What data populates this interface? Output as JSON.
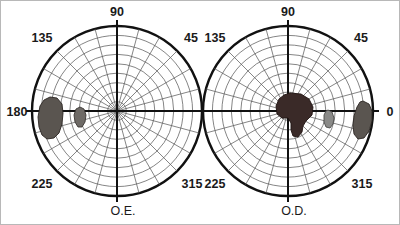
{
  "figure": {
    "background_color": "#ffffff",
    "width": 400,
    "height": 225,
    "grid_color": "#5c5c5c",
    "axis_color": "#111111",
    "outline_color": "#111111",
    "label_color": "#1a1a1a"
  },
  "chart_data": [
    {
      "type": "scatter",
      "chart_id": "left-polar-plot",
      "title": "O.E.",
      "subtitle": "",
      "projection": "polar",
      "xlabel": "",
      "ylabel": "",
      "center": {
        "x": 117,
        "y": 111
      },
      "outer_radius": 85,
      "rings": 9,
      "ring_radii": [
        9.4,
        18.9,
        28.3,
        37.8,
        47.2,
        56.7,
        66.1,
        75.6,
        85
      ],
      "spoke_step_degrees": 15,
      "spoke_count": 24,
      "major_axes_degrees": [
        0,
        90,
        180,
        270
      ],
      "grid": true,
      "legend_position": "none",
      "tick_labels": [
        "90",
        "45",
        "0",
        "315",
        "225",
        "180",
        "135"
      ],
      "visible_tick_labels": [
        "90",
        "135",
        "45",
        "180",
        "225",
        "315"
      ],
      "axis_range_degrees": [
        0,
        360
      ],
      "regions": [
        {
          "name": "large-scotoma-left-temporal",
          "label": "",
          "fill": "#5a5550",
          "outline": "#2b2622",
          "center_angle_deg": 178,
          "center_radius_units": 68,
          "approx_width_px": 23,
          "approx_height_px": 41,
          "points": "50,97 57,98 62,104 63,113 62,124 59,133 54,138 47,139 42,135 39,127 38,117 40,106 44,100"
        },
        {
          "name": "small-scotoma-left-paracentral",
          "label": "",
          "fill": "#6e6a66",
          "outline": "#3a3532",
          "center_angle_deg": 179,
          "center_radius_units": 36,
          "approx_width_px": 10,
          "approx_height_px": 20,
          "points": "80,107 84,109 86,115 85,122 82,127 78,127 75,122 74,115 76,109"
        }
      ]
    },
    {
      "type": "scatter",
      "chart_id": "right-polar-plot",
      "title": "O.D.",
      "subtitle": "",
      "projection": "polar",
      "xlabel": "",
      "ylabel": "",
      "center": {
        "x": 288,
        "y": 111
      },
      "outer_radius": 85,
      "rings": 9,
      "ring_radii": [
        9.4,
        18.9,
        28.3,
        37.8,
        47.2,
        56.7,
        66.1,
        75.6,
        85
      ],
      "spoke_step_degrees": 15,
      "spoke_count": 24,
      "major_axes_degrees": [
        0,
        90,
        180,
        270
      ],
      "grid": true,
      "legend_position": "none",
      "tick_labels": [
        "90",
        "45",
        "0",
        "315",
        "225",
        "180",
        "135"
      ],
      "visible_tick_labels": [
        "90",
        "135",
        "45",
        "0",
        "225",
        "315"
      ],
      "axis_range_degrees": [
        0,
        360
      ],
      "regions": [
        {
          "name": "central-scotoma-right",
          "label": "",
          "fill": "#3a2a28",
          "outline": "#201412",
          "center_angle_deg": 200,
          "center_radius_units": 14,
          "approx_width_px": 37,
          "approx_height_px": 45,
          "points": "290,93 301,94 309,99 313,107 312,115 306,121 303,126 302,132 298,137 293,136 291,130 291,123 288,118 282,118 277,114 276,106 279,99 284,95"
        },
        {
          "name": "small-scotoma-right-paracentral",
          "label": "",
          "fill": "#8a8a88",
          "outline": "#4a4a48",
          "center_angle_deg": 354,
          "center_radius_units": 36,
          "approx_width_px": 10,
          "approx_height_px": 19,
          "points": "328,110 332,112 334,118 333,124 330,128 326,127 324,122 324,115 326,111"
        },
        {
          "name": "blind-spot-right-temporal",
          "label": "",
          "fill": "#5a5550",
          "outline": "#2b2622",
          "center_angle_deg": 2,
          "center_radius_units": 73,
          "approx_width_px": 20,
          "approx_height_px": 39,
          "points": "363,101 369,104 372,111 372,121 369,131 364,138 358,139 354,134 353,126 354,116 357,107 360,102"
        }
      ]
    }
  ],
  "charts": [
    {
      "id": "left-polar-plot",
      "eye_label": "O.E.",
      "degree_labels": [
        {
          "text": "90",
          "x": 117,
          "y": 16,
          "anchor": "middle"
        },
        {
          "text": "135",
          "x": 42,
          "y": 42,
          "anchor": "middle"
        },
        {
          "text": "45",
          "x": 191,
          "y": 42,
          "anchor": "middle"
        },
        {
          "text": "180",
          "x": 17,
          "y": 116,
          "anchor": "middle"
        },
        {
          "text": "225",
          "x": 42,
          "y": 188,
          "anchor": "middle"
        },
        {
          "text": "315",
          "x": 192,
          "y": 188,
          "anchor": "middle"
        }
      ],
      "eye_label_pos": {
        "x": 123,
        "y": 215
      }
    },
    {
      "id": "right-polar-plot",
      "eye_label": "O.D.",
      "degree_labels": [
        {
          "text": "90",
          "x": 288,
          "y": 16,
          "anchor": "middle"
        },
        {
          "text": "135",
          "x": 215,
          "y": 42,
          "anchor": "middle"
        },
        {
          "text": "45",
          "x": 361,
          "y": 42,
          "anchor": "middle"
        },
        {
          "text": "0",
          "x": 390,
          "y": 116,
          "anchor": "middle"
        },
        {
          "text": "225",
          "x": 215,
          "y": 188,
          "anchor": "middle"
        },
        {
          "text": "315",
          "x": 362,
          "y": 188,
          "anchor": "middle"
        }
      ],
      "eye_label_pos": {
        "x": 294,
        "y": 215
      }
    }
  ]
}
